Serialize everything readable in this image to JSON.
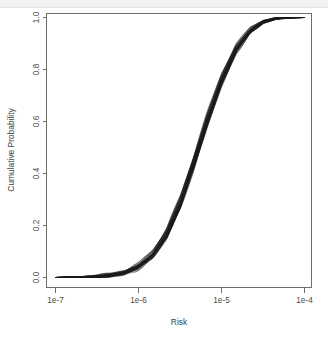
{
  "figure": {
    "background_color": "#ffffff",
    "frame_color": "#6e6e6e",
    "line_color": "#1a1a1a",
    "top_band_color": "#f2f2f2"
  },
  "chart_data": {
    "type": "line",
    "title": "",
    "subtitle": "",
    "xlabel": "Risk",
    "ylabel": "Cumulative Probability",
    "x_scale": "log",
    "y_scale": "linear",
    "xlim": [
      1e-07,
      0.0001
    ],
    "ylim": [
      0.0,
      1.0
    ],
    "grid": false,
    "legend": null,
    "legend_position": "none",
    "x_tick_labels": [
      "1e-7",
      "1e-6",
      "1e-5",
      "1e-4"
    ],
    "x_tick_values": [
      1e-07,
      1e-06,
      1e-05,
      0.0001
    ],
    "y_tick_labels": [
      "0.0",
      "0.2",
      "0.4",
      "0.6",
      "0.8",
      "1.0"
    ],
    "y_tick_values": [
      0.0,
      0.2,
      0.4,
      0.6,
      0.8,
      1.0
    ],
    "annotations": [],
    "n_series": 40,
    "x": [
      1e-07,
      1.5e-07,
      2.2e-07,
      3.2e-07,
      4.6e-07,
      6.8e-07,
      1e-06,
      1.5e-06,
      2.2e-06,
      3.2e-06,
      4.6e-06,
      6.8e-06,
      1e-05,
      1.5e-05,
      2.2e-05,
      3.2e-05,
      4.6e-05,
      6.8e-05,
      0.0001
    ],
    "series": [
      {
        "name": "median CDF",
        "values": [
          0.0,
          0.001,
          0.002,
          0.004,
          0.008,
          0.018,
          0.042,
          0.09,
          0.17,
          0.29,
          0.44,
          0.61,
          0.76,
          0.88,
          0.95,
          0.985,
          0.997,
          1.0,
          1.0
        ]
      },
      {
        "name": "lower envelope",
        "values": [
          0.0,
          0.0,
          0.001,
          0.003,
          0.006,
          0.014,
          0.034,
          0.076,
          0.15,
          0.266,
          0.414,
          0.585,
          0.737,
          0.862,
          0.938,
          0.978,
          0.994,
          0.999,
          1.0
        ]
      },
      {
        "name": "upper envelope",
        "values": [
          0.0,
          0.002,
          0.004,
          0.007,
          0.013,
          0.026,
          0.054,
          0.108,
          0.195,
          0.318,
          0.468,
          0.636,
          0.784,
          0.898,
          0.962,
          0.991,
          0.999,
          1.0,
          1.0
        ]
      }
    ]
  },
  "axes": {
    "x_title": "Risk",
    "y_title": "Cumulative Probability"
  }
}
